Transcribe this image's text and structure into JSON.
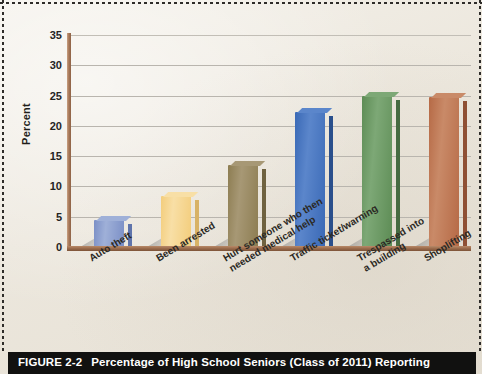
{
  "figure": {
    "caption_number": "FIGURE 2-2",
    "caption_text": "Percentage of High School Seniors (Class of 2011) Reporting"
  },
  "chart_data": {
    "type": "bar",
    "title": "",
    "xlabel": "",
    "ylabel": "Percent",
    "ylim": [
      0,
      35
    ],
    "ytick_step": 5,
    "yticks": [
      35,
      30,
      25,
      20,
      15,
      10,
      5,
      0
    ],
    "grid": true,
    "legend": "none",
    "categories": [
      "Auto theft",
      "Been arrested",
      "Hurt someone who then\nneeded medical help",
      "Traffic ticket/warning",
      "Trespassed into\na building",
      "Shoplifting"
    ],
    "values": [
      4.5,
      8.5,
      13.5,
      22.3,
      25.0,
      24.7
    ],
    "bar_colors": [
      "#7b8fc6",
      "#f3cd7c",
      "#8d7d52",
      "#3a69b6",
      "#5d8c55",
      "#b66a46"
    ],
    "bar_top_colors": [
      "#9fb0d8",
      "#f8dfa6",
      "#a79875",
      "#5b86cb",
      "#7da876",
      "#c98a68"
    ],
    "bar_side_colors": [
      "#5f74ab",
      "#d8b266",
      "#6f6240",
      "#2a4f8c",
      "#466b41",
      "#8f5034"
    ]
  },
  "axis_colors": {
    "axis_line": "#9a6b4c",
    "gridline": "#b9b5ae"
  }
}
